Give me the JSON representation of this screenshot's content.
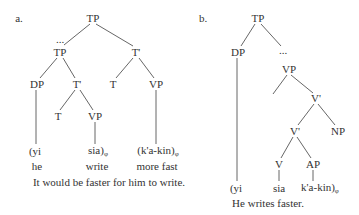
{
  "tree_a": {
    "label": "a.",
    "nodes": {
      "root": "TP",
      "ellipsis": "...",
      "tp_left": "TP",
      "tbar_right": "T'",
      "dp": "DP",
      "tbar_mid": "T'",
      "t_right": "T",
      "vp_right": "VP",
      "t_low": "T",
      "vp_low": "VP"
    },
    "leaves": {
      "yi": "(yi",
      "sia": "sia)",
      "sia_sub": "φ",
      "kakin": "(k'a-kin)",
      "kakin_sub": "φ"
    },
    "glosses": {
      "he": "he",
      "write": "write",
      "more_fast": "more fast"
    },
    "caption": "It would be faster for him to write."
  },
  "tree_b": {
    "label": "b.",
    "nodes": {
      "root": "TP",
      "dp": "DP",
      "ellipsis": "...",
      "vp": "VP",
      "vbar_top": "V'",
      "vbar_low": "V'",
      "np": "NP",
      "v": "V",
      "ap": "AP"
    },
    "leaves": {
      "yi": "(yi",
      "sia": "sia",
      "kakin": "k'a-kin)",
      "kakin_sub": "φ"
    },
    "caption": "He writes faster."
  }
}
